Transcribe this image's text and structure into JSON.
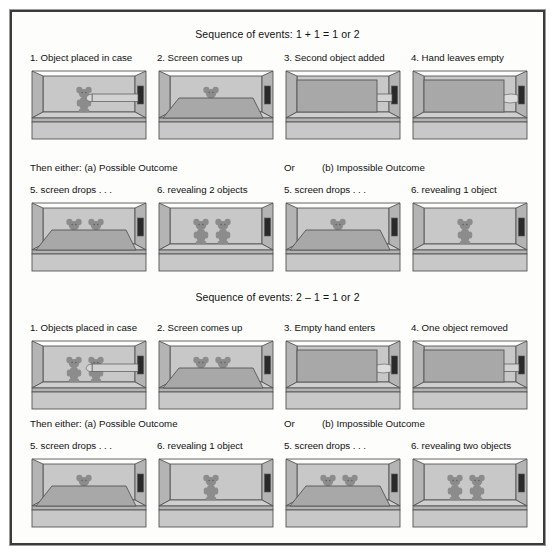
{
  "figure": {
    "background": "#fdfdfc",
    "border_color": "#3b3b3b",
    "case_wall_color": "#c8c8c8",
    "case_floor_color": "#cfcfcf",
    "case_side_color": "#b4b4b4",
    "screen_color": "#a8a8a8",
    "object_color": "#8c8c8c",
    "aperture_color": "#2a2a2a"
  },
  "sections": [
    {
      "id": "addition",
      "title": "Sequence of events: 1 + 1 = 1 or 2",
      "steps": [
        {
          "caption": "1. Object placed in case",
          "objects": 1,
          "screen": "down",
          "hand": "holding"
        },
        {
          "caption": "2. Screen comes up",
          "objects": 1,
          "screen": "rising",
          "hand": "none"
        },
        {
          "caption": "3. Second object added",
          "objects": 1,
          "screen": "up",
          "hand": "holding"
        },
        {
          "caption": "4. Hand leaves empty",
          "objects": 0,
          "screen": "up",
          "hand": "empty"
        }
      ],
      "divider": {
        "left_label": "Then either: (a) Possible Outcome",
        "or_label": "Or",
        "right_label": "(b) Impossible Outcome"
      },
      "outcomes": [
        {
          "caption": "5. screen drops . . .",
          "objects": 2,
          "screen": "dropping",
          "hand": "none"
        },
        {
          "caption": "6. revealing 2 objects",
          "objects": 2,
          "screen": "down",
          "hand": "none"
        },
        {
          "caption": "5. screen drops . . .",
          "objects": 1,
          "screen": "dropping",
          "hand": "none"
        },
        {
          "caption": "6. revealing 1 object",
          "objects": 1,
          "screen": "down",
          "hand": "none"
        }
      ]
    },
    {
      "id": "subtraction",
      "title": "Sequence of events: 2 – 1 = 1 or 2",
      "steps": [
        {
          "caption": "1. Objects placed in case",
          "objects": 2,
          "screen": "down",
          "hand": "holding"
        },
        {
          "caption": "2. Screen comes up",
          "objects": 2,
          "screen": "rising",
          "hand": "none"
        },
        {
          "caption": "3. Empty hand enters",
          "objects": 0,
          "screen": "up",
          "hand": "empty"
        },
        {
          "caption": "4. One object removed",
          "objects": 0,
          "screen": "up",
          "hand": "holding"
        }
      ],
      "divider": {
        "left_label": "Then either: (a) Possible Outcome",
        "or_label": "Or",
        "right_label": "(b) Impossible Outcome"
      },
      "outcomes": [
        {
          "caption": "5. screen drops . . .",
          "objects": 1,
          "screen": "dropping",
          "hand": "none"
        },
        {
          "caption": "6. revealing 1 object",
          "objects": 1,
          "screen": "down",
          "hand": "none"
        },
        {
          "caption": "5. screen drops . . .",
          "objects": 2,
          "screen": "dropping",
          "hand": "none"
        },
        {
          "caption": "6. revealing two objects",
          "objects": 2,
          "screen": "down",
          "hand": "none"
        }
      ]
    }
  ]
}
